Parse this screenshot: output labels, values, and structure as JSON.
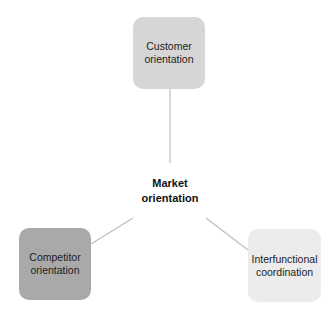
{
  "diagram": {
    "center": {
      "label_line1": "Market",
      "label_line2": "orientation"
    },
    "nodes": [
      {
        "id": "customer",
        "line1": "Customer",
        "line2": "orientation",
        "color": "#d6d6d6"
      },
      {
        "id": "competitor",
        "line1": "Competitor",
        "line2": "orientation",
        "color": "#a9a9a9"
      },
      {
        "id": "interfunctional",
        "line1": "Interfunctional",
        "line2": "coordination",
        "color": "#ececec"
      }
    ],
    "edge_color": "#bdbdbd"
  }
}
